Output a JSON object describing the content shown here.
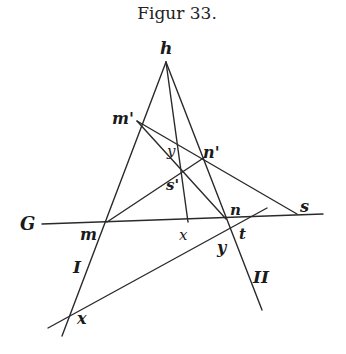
{
  "figure": {
    "title": "Figur 33.",
    "labels": {
      "h": "h",
      "m_prime": "m'",
      "n_prime": "n'",
      "y_top": "y",
      "s_prime": "s'",
      "G": "G",
      "m": "m",
      "x_mid": "x",
      "n": "n",
      "s": "s",
      "t": "t",
      "y": "y",
      "I": "I",
      "II": "II",
      "x": "x"
    },
    "colors": {
      "line": "#2a2a2a",
      "text": "#1a1a1a",
      "background": "#ffffff"
    }
  },
  "geometry": {
    "points": {
      "h": [
        166,
        62
      ],
      "m_prime": [
        137,
        121
      ],
      "n_prime": [
        205,
        157
      ],
      "y_top": [
        183,
        153
      ],
      "s_prime": [
        189,
        168
      ],
      "m": [
        107,
        222
      ],
      "x_mid": [
        188,
        222
      ],
      "n": [
        226,
        219
      ],
      "t": [
        247,
        218
      ],
      "s": [
        297,
        214
      ],
      "y": [
        229,
        230
      ],
      "x": [
        70,
        313
      ]
    },
    "lines": {
      "G": [
        [
          42,
          224
        ],
        [
          323,
          214
        ]
      ],
      "I": [
        [
          166,
          62
        ],
        [
          62,
          336
        ]
      ],
      "II": [
        [
          166,
          62
        ],
        [
          262,
          310
        ]
      ],
      "h_to_x_mid": [
        [
          166,
          62
        ],
        [
          188,
          222
        ]
      ],
      "m_prime_to_s": [
        [
          137,
          121
        ],
        [
          297,
          214
        ]
      ],
      "m_prime_to_n": [
        [
          137,
          121
        ],
        [
          226,
          219
        ]
      ],
      "m_to_n_prime": [
        [
          107,
          222
        ],
        [
          205,
          157
        ]
      ],
      "x_line": [
        [
          48,
          328
        ],
        [
          267,
          208
        ]
      ]
    }
  }
}
